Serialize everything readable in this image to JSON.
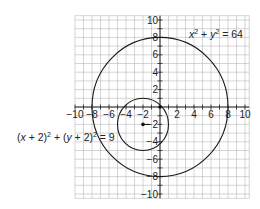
{
  "chart_data": {
    "type": "scatter",
    "title": "",
    "xlabel": "",
    "ylabel": "",
    "xlim": [
      -10,
      10
    ],
    "ylim": [
      -10,
      10
    ],
    "grid": true,
    "grid_step": 1,
    "x_ticks": [
      -10,
      -8,
      -6,
      -4,
      -2,
      2,
      4,
      6,
      8,
      10
    ],
    "y_ticks": [
      10,
      8,
      6,
      4,
      2,
      -2,
      -4,
      -6,
      -8,
      -10
    ],
    "x_tick_labels": [
      "−10",
      "−8",
      "−6",
      "−4",
      "−2",
      "2",
      "4",
      "6",
      "8",
      "10"
    ],
    "y_tick_labels": [
      "10",
      "8",
      "6",
      "4",
      "2",
      "−2",
      "−4",
      "−6",
      "−8",
      "−10"
    ],
    "series": [
      {
        "name": "x² + y² = 64",
        "shape": "circle",
        "center": [
          0,
          0
        ],
        "radius": 8
      },
      {
        "name": "(x + 2)² + (y + 2)² = 9",
        "shape": "circle",
        "center": [
          -2,
          -2
        ],
        "radius": 3
      }
    ],
    "points": [
      {
        "x": -2,
        "y": -2,
        "label": "center of small circle"
      },
      {
        "x": 0,
        "y": 0,
        "label": "origin"
      }
    ],
    "annotations": [
      {
        "text": "x² + y² = 64",
        "position": "upper-right"
      },
      {
        "text": "(x + 2)² + (y + 2)² = 9",
        "position": "left"
      }
    ]
  },
  "labels": {
    "big_circle": {
      "x": "x",
      "plus": " + ",
      "y": "y",
      "exp": "2",
      "rhs": " = 64"
    },
    "small_circle": {
      "open1": "(",
      "x": "x",
      "mid1": " + 2)",
      "plus": " + (",
      "y": "y",
      "mid2": " + 2)",
      "exp": "2",
      "rhs": " = 9"
    }
  }
}
